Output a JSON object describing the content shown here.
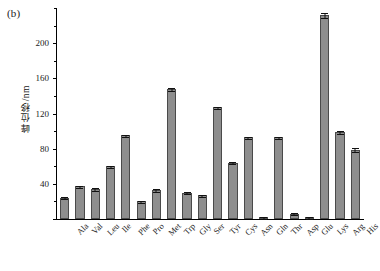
{
  "panel": {
    "label": "(b)"
  },
  "chart_data": {
    "type": "bar",
    "title": "",
    "xlabel": "",
    "ylabel": "峰位移/nm",
    "categories": [
      "Ala",
      "Val",
      "Leu",
      "Ile",
      "Phe",
      "Pro",
      "Met",
      "Trp",
      "Gly",
      "Ser",
      "Tyr",
      "Cys",
      "Asn",
      "Gln",
      "Thr",
      "Asp",
      "Glu",
      "Lys",
      "Arg",
      "His"
    ],
    "values": [
      24,
      37,
      34,
      60,
      95,
      20,
      33,
      148,
      30,
      27,
      127,
      64,
      93,
      2,
      93,
      6,
      1,
      232,
      99,
      79
    ],
    "errors": [
      1.5,
      2.0,
      2.0,
      1.5,
      1.5,
      1.5,
      2.0,
      2.0,
      1.5,
      1.5,
      2.0,
      1.5,
      1.5,
      1.5,
      1.5,
      1.5,
      1.0,
      3.0,
      2.0,
      3.0
    ],
    "ylim": [
      0,
      240
    ],
    "yticks": [
      0,
      40,
      80,
      120,
      160,
      200
    ],
    "ytick_labels": [
      "",
      "40",
      "80",
      "120",
      "160",
      "200"
    ],
    "yminor": [
      20,
      60,
      100,
      140,
      180,
      220,
      240
    ],
    "grid": false,
    "legend": null,
    "bar_color": "#8e8e8e",
    "bar_edge_color": "#4a4a4a",
    "error_color": "#111111",
    "axis_color": "#000000"
  }
}
